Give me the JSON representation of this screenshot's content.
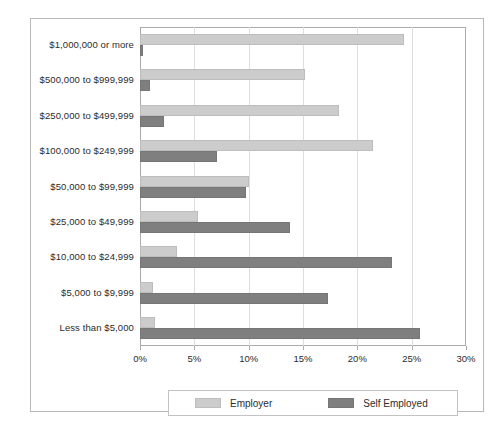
{
  "chart_data": {
    "type": "bar",
    "orientation": "horizontal",
    "title": "",
    "xlabel": "",
    "ylabel": "",
    "xlim": [
      0,
      30
    ],
    "xticks": [
      "0%",
      "5%",
      "10%",
      "15%",
      "20%",
      "25%",
      "30%"
    ],
    "xtick_values": [
      0,
      5,
      10,
      15,
      20,
      25,
      30
    ],
    "grid": true,
    "legend_position": "bottom",
    "categories": [
      "$1,000,000 or more",
      "$500,000 to $999,999",
      "$250,000 to $499,999",
      "$100,000 to $249,999",
      "$50,000 to $99,999",
      "$25,000 to $49,999",
      "$10,000 to $24,999",
      "$5,000 to $9,999",
      "Less than $5,000"
    ],
    "series": [
      {
        "name": "Employer",
        "color": "#cccccc",
        "values": [
          24.3,
          15.2,
          18.3,
          21.4,
          10.0,
          5.3,
          3.4,
          1.2,
          1.4
        ]
      },
      {
        "name": "Self Employed",
        "color": "#7f7f7f",
        "values": [
          0.3,
          0.9,
          2.2,
          7.1,
          9.8,
          13.8,
          23.2,
          17.3,
          25.8
        ]
      }
    ]
  },
  "legend": {
    "entries": [
      {
        "label": "Employer",
        "color": "#cccccc",
        "swatch_name": "employer-swatch"
      },
      {
        "label": "Self Employed",
        "color": "#7f7f7f",
        "swatch_name": "self-employed-swatch"
      }
    ]
  }
}
